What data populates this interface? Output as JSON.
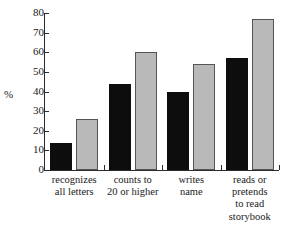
{
  "chart_data": {
    "type": "bar",
    "title": "",
    "subtitle": "",
    "xlabel": "",
    "ylabel": "%",
    "ylim": [
      0,
      80
    ],
    "yticks": [
      0,
      10,
      20,
      30,
      40,
      50,
      60,
      70,
      80
    ],
    "ytick_labels": [
      "0",
      "10",
      "20",
      "30",
      "40",
      "50",
      "60",
      "70",
      "80"
    ],
    "grid": false,
    "legend": "none",
    "categories": [
      "recognizes\nall letters",
      "counts to\n20 or higher",
      "writes\nname",
      "reads or\npretends\nto read\nstorybook"
    ],
    "series": [
      {
        "name": "series-dark",
        "color": "#0d0d0d",
        "values": [
          14,
          44,
          40,
          57
        ]
      },
      {
        "name": "series-light",
        "color": "#b9b9b9",
        "values": [
          26,
          60,
          54,
          77
        ]
      }
    ]
  },
  "colors": {
    "dark_bar": "#0d0d0d",
    "light_bar": "#b9b9b9",
    "axis": "#2b2b2b",
    "background": "#ffffff",
    "text": "#1a1a1a"
  }
}
